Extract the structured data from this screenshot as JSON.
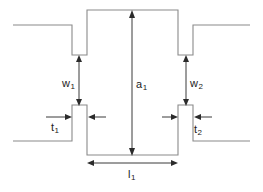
{
  "diagram": {
    "type": "technical-cross-section",
    "colors": {
      "background": "#ffffff",
      "profile_stroke": "#8a8a8a",
      "dimension_stroke": "#3a3a3a",
      "label_text": "#222222"
    },
    "labels": [
      {
        "id": "w1",
        "base": "w",
        "sub": "1",
        "x": 62,
        "y": 78,
        "orientation": "vertical-dimension",
        "side": "left"
      },
      {
        "id": "a1",
        "base": "a",
        "sub": "1",
        "x": 136,
        "y": 79,
        "orientation": "vertical-dimension",
        "side": "center"
      },
      {
        "id": "w2",
        "base": "w",
        "sub": "2",
        "x": 190,
        "y": 78,
        "orientation": "vertical-dimension",
        "side": "right"
      },
      {
        "id": "t1",
        "base": "t",
        "sub": "1",
        "x": 51,
        "y": 122,
        "orientation": "horizontal-dimension",
        "side": "left"
      },
      {
        "id": "t2",
        "base": "t",
        "sub": "2",
        "x": 194,
        "y": 124,
        "orientation": "horizontal-dimension",
        "side": "right"
      },
      {
        "id": "l1",
        "base": "l",
        "sub": "1",
        "x": 128,
        "y": 169,
        "orientation": "horizontal-dimension",
        "side": "bottom"
      }
    ],
    "geometry": {
      "profile_path": "M 13 25 L 72 25 L 72 55 L 87 55 L 87 10 L 178 10 L 178 55 L 193 55 L 193 25 L 250 25",
      "profile_path_lower": "M 13 141 L 72 141 L 72 105 L 87 105 L 87 155 L 178 155 L 178 105 L 193 105 L 193 141 L 250 141",
      "dimensions": [
        {
          "id": "w1",
          "kind": "vertical",
          "x": 79,
          "y_start": 57,
          "y_end": 104,
          "arrow_start": "up",
          "arrow_end": "down"
        },
        {
          "id": "a1",
          "kind": "vertical",
          "x": 132,
          "y_start": 12,
          "y_end": 154,
          "arrow_start": "up",
          "arrow_end": "down"
        },
        {
          "id": "w2",
          "kind": "vertical",
          "x": 186,
          "y_start": 57,
          "y_end": 104,
          "arrow_start": "up",
          "arrow_end": "down"
        },
        {
          "id": "t1_left",
          "kind": "horizontal",
          "y": 117,
          "x_start": 46,
          "x_end": 71,
          "arrow_end": "right"
        },
        {
          "id": "t1_right",
          "kind": "horizontal",
          "y": 117,
          "x_start": 105,
          "x_end": 89,
          "arrow_end": "left"
        },
        {
          "id": "t2_left",
          "kind": "horizontal",
          "y": 117,
          "x_start": 162,
          "x_end": 177,
          "arrow_end": "right"
        },
        {
          "id": "t2_right",
          "kind": "horizontal",
          "y": 117,
          "x_start": 211,
          "x_end": 195,
          "arrow_end": "left"
        },
        {
          "id": "l1",
          "kind": "horizontal",
          "y": 163,
          "x_start": 88,
          "x_end": 177,
          "arrow_start": "left",
          "arrow_end": "right"
        }
      ]
    }
  }
}
